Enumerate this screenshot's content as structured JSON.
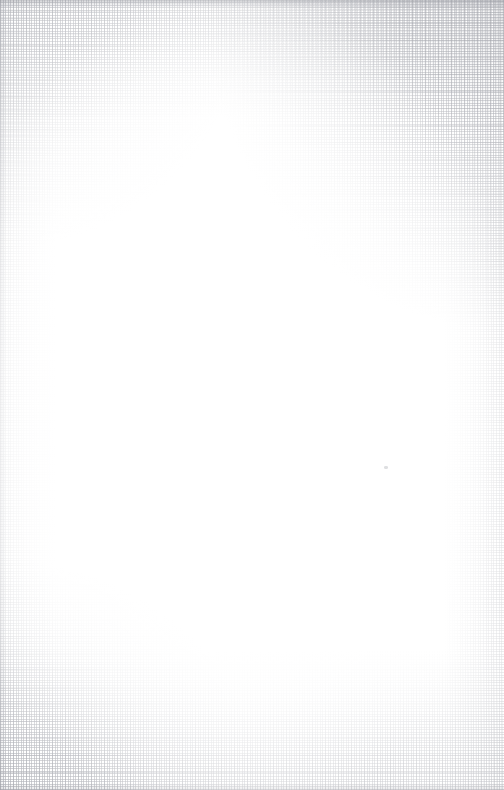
{
  "image": {
    "subject": "Blank textured canvas sheet",
    "orientation": "portrait",
    "width_px": 504,
    "height_px": 790,
    "surface": "woven linen / artist canvas",
    "content_text": "",
    "caption": ""
  },
  "colors": {
    "paper": "#ffffff",
    "weave_thread": "#acaeb4",
    "weave_shadow": "#e8e8ea",
    "edge_shade": "#8a8c94",
    "speck": "#b0b2b8"
  },
  "regions": [
    {
      "name": "top-right-corner",
      "texture": "strong weave",
      "intensity": "high"
    },
    {
      "name": "top-left-corner",
      "texture": "moderate weave",
      "intensity": "medium"
    },
    {
      "name": "top-edge",
      "texture": "weave band with dark hairline",
      "intensity": "medium"
    },
    {
      "name": "bottom-edge",
      "texture": "weave band",
      "intensity": "medium"
    },
    {
      "name": "bottom-left-corner",
      "texture": "moderate weave",
      "intensity": "medium"
    },
    {
      "name": "left-edge",
      "texture": "faint weave",
      "intensity": "low"
    },
    {
      "name": "right-edge",
      "texture": "faint weave",
      "intensity": "low"
    },
    {
      "name": "center",
      "texture": "none — plain white",
      "intensity": "none"
    }
  ],
  "artifacts": [
    {
      "name": "dust-speck",
      "x": 386,
      "y": 468,
      "note": "tiny grey fibre mark"
    }
  ]
}
